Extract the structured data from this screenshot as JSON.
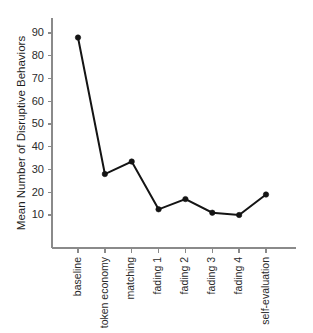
{
  "chart_data": {
    "type": "line",
    "title": "",
    "subtitle": "",
    "xlabel": "",
    "ylabel": "Mean Number of Disruptive Behaviors",
    "categories": [
      "baseline",
      "token economy",
      "matching",
      "fading 1",
      "fading 2",
      "fading 3",
      "fading 4",
      "self-evaluation"
    ],
    "values": [
      88,
      28,
      33.5,
      12.5,
      17,
      11,
      10,
      19
    ],
    "series": [
      {
        "name": "Mean Number of Disruptive Behaviors",
        "values": [
          88,
          28,
          33.5,
          12.5,
          17,
          11,
          10,
          19
        ]
      }
    ],
    "ytick_labels": [
      "10",
      "20",
      "30",
      "40",
      "50",
      "60",
      "70",
      "80",
      "90"
    ],
    "ytick_values": [
      10,
      20,
      30,
      40,
      50,
      60,
      70,
      80,
      90
    ],
    "ylim": [
      0,
      95
    ],
    "grid": false,
    "legend": false,
    "legend_position": "none",
    "marker": "filled-circle",
    "line_color": "#141414",
    "marker_color": "#141414",
    "axis_color": "#8a8a8a",
    "background_color": "#ffffff",
    "xtick_label_rotation": -90
  }
}
